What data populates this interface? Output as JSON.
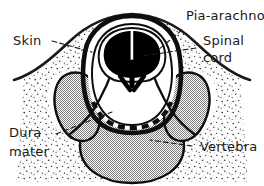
{
  "figure": {
    "name": "spinal-column-cross-section",
    "background_color": "#ffffff",
    "ink_color": "#1a1a1a",
    "bone_fill_color": "#a8a8a8",
    "cord_gray_matter_color": "#000000",
    "cord_white_matter_color": "#ffffff",
    "soft_tissue_texture": "stipple-dots"
  },
  "labels": {
    "pia_arachnoid": "Pia-arachnoid",
    "spinal_cord_line1": "Spinal",
    "spinal_cord_line2": "cord",
    "skin": "Skin",
    "dura_line1": "Dura",
    "dura_line2": "mater",
    "vertebra": "Vertebra"
  }
}
